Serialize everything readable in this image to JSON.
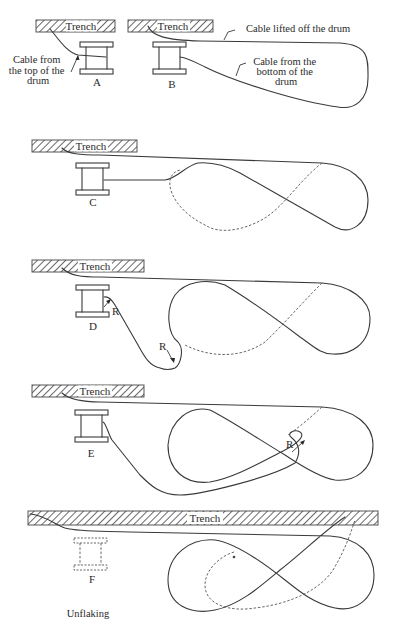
{
  "figure": {
    "panels": [
      {
        "id": "A",
        "label": "A",
        "trench_label": "Trench",
        "annotation": [
          "Cable from",
          "the top of the",
          "drum"
        ]
      },
      {
        "id": "B",
        "label": "B",
        "trench_label": "Trench",
        "annotations": {
          "lifted": "Cable lifted off the drum",
          "bottom": [
            "Cable from the",
            "bottom of the",
            "drum"
          ]
        }
      },
      {
        "id": "C",
        "label": "C",
        "trench_label": "Trench"
      },
      {
        "id": "D",
        "label": "D",
        "trench_label": "Trench",
        "radius_labels": [
          "R",
          "R"
        ]
      },
      {
        "id": "E",
        "label": "E",
        "trench_label": "Trench",
        "radius_labels": [
          "R"
        ]
      },
      {
        "id": "F",
        "label": "F",
        "trench_label": "Trench",
        "caption": "Unflaking"
      }
    ]
  },
  "colors": {
    "line": "#3a3a3a",
    "background": "#ffffff"
  }
}
